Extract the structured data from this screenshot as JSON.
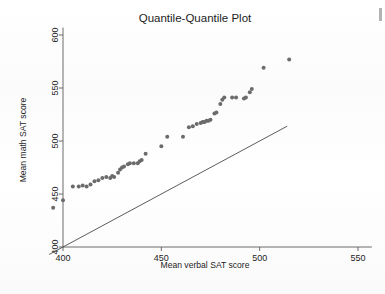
{
  "page": {
    "background_color": "#ffffff",
    "corner_mark_color": "#9a9a9a"
  },
  "chart_data": {
    "type": "scatter",
    "title": "Quantile-Quantile Plot",
    "xlabel": "Mean verbal SAT score",
    "ylabel": "Mean math SAT score",
    "xlim": [
      392,
      557
    ],
    "ylim": [
      392,
      607
    ],
    "xticks": [
      400,
      450,
      500,
      550
    ],
    "yticks": [
      400,
      450,
      500,
      550,
      600
    ],
    "xtick_labels": [
      "400",
      "450",
      "500",
      "550"
    ],
    "ytick_labels": [
      "400",
      "450",
      "500",
      "550",
      "600"
    ],
    "grid": false,
    "legend": null,
    "point_color": "#6b6b6b",
    "line_color": "#4a4a4a",
    "series": [
      {
        "name": "State SAT quantile pairs",
        "marker": "circle",
        "points": [
          [
            395,
            437
          ],
          [
            400,
            444
          ],
          [
            405,
            457
          ],
          [
            408,
            457
          ],
          [
            410,
            458
          ],
          [
            412,
            457
          ],
          [
            414,
            459
          ],
          [
            416,
            462
          ],
          [
            418,
            463
          ],
          [
            420,
            465
          ],
          [
            422,
            466
          ],
          [
            424,
            465
          ],
          [
            425,
            467
          ],
          [
            426,
            466
          ],
          [
            428,
            470
          ],
          [
            429,
            473
          ],
          [
            430,
            475
          ],
          [
            431,
            476
          ],
          [
            433,
            478
          ],
          [
            434,
            479
          ],
          [
            436,
            479
          ],
          [
            438,
            479
          ],
          [
            439,
            481
          ],
          [
            440,
            482
          ],
          [
            442,
            488
          ],
          [
            450,
            495
          ],
          [
            453,
            504
          ],
          [
            461,
            504
          ],
          [
            464,
            513
          ],
          [
            466,
            514
          ],
          [
            468,
            516
          ],
          [
            470,
            517
          ],
          [
            471,
            518
          ],
          [
            472,
            518
          ],
          [
            473,
            519
          ],
          [
            474,
            519
          ],
          [
            475,
            520
          ],
          [
            477,
            526
          ],
          [
            478,
            527
          ],
          [
            480,
            535
          ],
          [
            481,
            539
          ],
          [
            482,
            541
          ],
          [
            486,
            541
          ],
          [
            488,
            541
          ],
          [
            492,
            540
          ],
          [
            493,
            541
          ],
          [
            495,
            546
          ],
          [
            496,
            549
          ],
          [
            502,
            569
          ],
          [
            515,
            577
          ]
        ]
      }
    ],
    "reference_line": {
      "name": "y = x reference line",
      "start": [
        393,
        393
      ],
      "end": [
        514,
        514
      ]
    }
  }
}
